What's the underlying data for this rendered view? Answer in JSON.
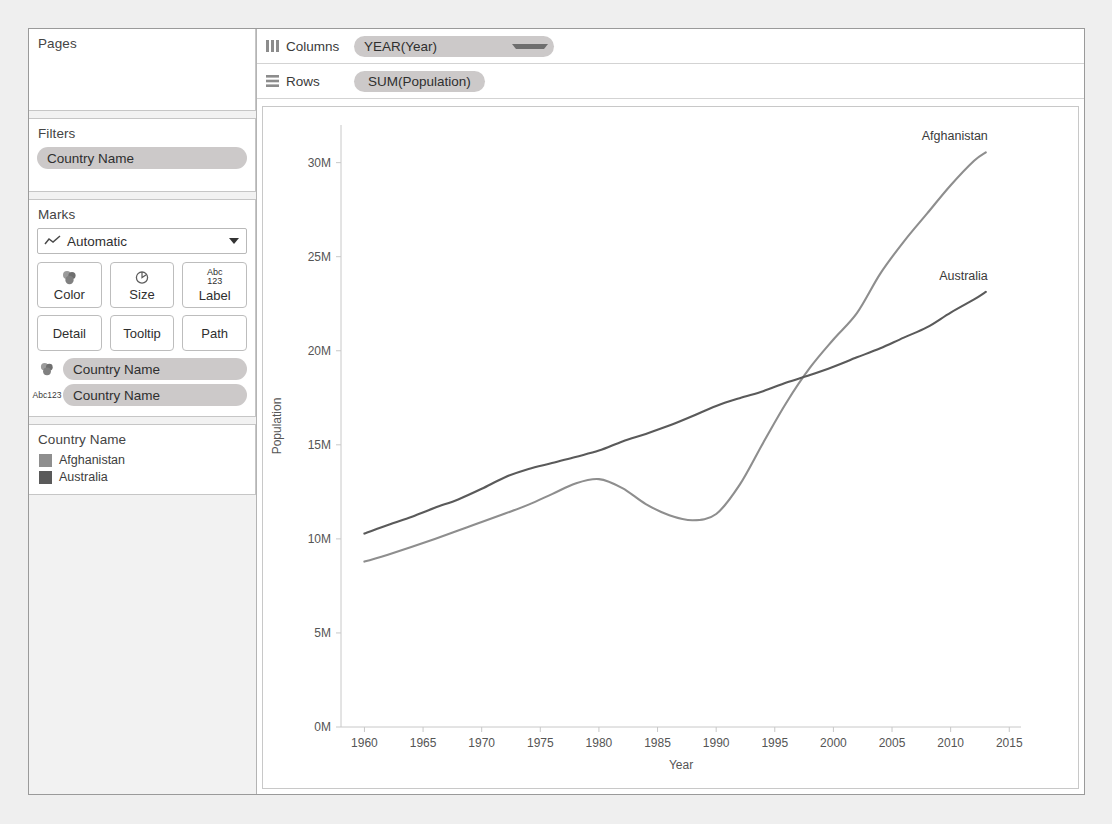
{
  "sidebar": {
    "pages": {
      "title": "Pages"
    },
    "filters": {
      "title": "Filters",
      "pills": [
        "Country Name"
      ]
    },
    "marks": {
      "title": "Marks",
      "type_selected": "Automatic",
      "type_icon": "line-chart-icon",
      "buttons": [
        {
          "label": "Color",
          "icon": "color-palette-icon"
        },
        {
          "label": "Size",
          "icon": "size-circle-icon"
        },
        {
          "label": "Label",
          "icon": "abc-123-icon",
          "abc": "Abc",
          "num": "123"
        },
        {
          "label": "Detail",
          "icon": ""
        },
        {
          "label": "Tooltip",
          "icon": ""
        },
        {
          "label": "Path",
          "icon": ""
        }
      ],
      "pills": [
        {
          "label": "Country Name",
          "icon": "color-palette-icon"
        },
        {
          "label": "Country Name",
          "icon": "abc-123-icon",
          "abc": "Abc",
          "num": "123"
        }
      ]
    },
    "legend": {
      "title": "Country Name",
      "items": [
        {
          "label": "Afghanistan",
          "color": "#8e8e8e"
        },
        {
          "label": "Australia",
          "color": "#5a5a5a"
        }
      ]
    }
  },
  "shelves": {
    "columns": {
      "label": "Columns",
      "icon": "columns-icon",
      "pill": "YEAR(Year)"
    },
    "rows": {
      "label": "Rows",
      "icon": "rows-icon",
      "pill": "SUM(Population)"
    }
  },
  "chart_data": {
    "type": "line",
    "title": "",
    "xlabel": "Year",
    "ylabel": "Population",
    "xlim": [
      1958,
      2016
    ],
    "ylim": [
      0,
      32000000
    ],
    "grid": false,
    "legend_position": "right-inline-labels",
    "xticks": [
      1960,
      1965,
      1970,
      1975,
      1980,
      1985,
      1990,
      1995,
      2000,
      2005,
      2010,
      2015
    ],
    "yticks": [
      0,
      5000000,
      10000000,
      15000000,
      20000000,
      25000000,
      30000000
    ],
    "yticklabels": [
      "0M",
      "5M",
      "10M",
      "15M",
      "20M",
      "25M",
      "30M"
    ],
    "xticklabels": [
      "1960",
      "1965",
      "1970",
      "1975",
      "1980",
      "1985",
      "1990",
      "1995",
      "2000",
      "2005",
      "2010",
      "2015"
    ],
    "x": [
      1960,
      1962,
      1964,
      1966,
      1968,
      1970,
      1972,
      1974,
      1976,
      1978,
      1980,
      1982,
      1984,
      1986,
      1988,
      1990,
      1992,
      1994,
      1996,
      1998,
      2000,
      2002,
      2004,
      2006,
      2008,
      2010,
      2012,
      2013
    ],
    "series": [
      {
        "name": "Afghanistan",
        "color": "#8e8e8e",
        "label": "Afghanistan",
        "values": [
          8790000,
          9160000,
          9570000,
          10000000,
          10450000,
          10890000,
          11350000,
          11820000,
          12380000,
          12950000,
          13180000,
          12700000,
          11850000,
          11260000,
          10990000,
          11320000,
          12870000,
          15100000,
          17250000,
          19100000,
          20600000,
          22000000,
          24100000,
          25800000,
          27300000,
          28800000,
          30100000,
          30550000
        ]
      },
      {
        "name": "Australia",
        "color": "#5a5a5a",
        "label": "Australia",
        "values": [
          10280000,
          10740000,
          11170000,
          11650000,
          12100000,
          12660000,
          13280000,
          13720000,
          14030000,
          14360000,
          14690000,
          15180000,
          15580000,
          16020000,
          16530000,
          17070000,
          17480000,
          17850000,
          18310000,
          18710000,
          19150000,
          19650000,
          20130000,
          20700000,
          21250000,
          22030000,
          22730000,
          23130000
        ]
      }
    ]
  }
}
